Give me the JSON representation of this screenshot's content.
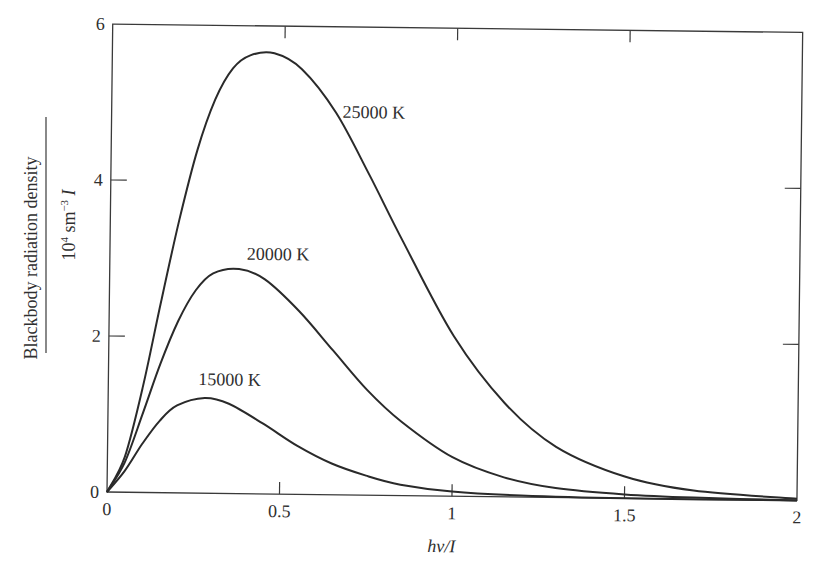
{
  "chart_data": {
    "type": "line",
    "title": "",
    "xlabel": "hv/I",
    "ylabel": {
      "numerator": "Blackbody radiation density",
      "denominator_base": "10",
      "denominator_exp1": "4",
      "denominator_mid": " sm",
      "denominator_exp2": "−3",
      "denominator_tail": " I"
    },
    "xlim": [
      0,
      2
    ],
    "ylim": [
      0,
      6
    ],
    "x_ticks": [
      "0",
      "0.5",
      "1",
      "1.5",
      "2"
    ],
    "y_ticks": [
      "0",
      "2",
      "4",
      "6"
    ],
    "grid": false,
    "legend": "inline labels",
    "series": [
      {
        "name": "25000 K",
        "label": "25000 K",
        "peak": {
          "x": 0.47,
          "y": 5.65
        },
        "x": [
          0,
          0.05,
          0.1,
          0.15,
          0.2,
          0.25,
          0.3,
          0.35,
          0.4,
          0.47,
          0.55,
          0.65,
          0.75,
          0.85,
          1.0,
          1.15,
          1.3,
          1.5,
          1.7,
          2.0
        ],
        "values": [
          0,
          0.45,
          1.35,
          2.45,
          3.5,
          4.4,
          5.05,
          5.45,
          5.62,
          5.65,
          5.45,
          4.9,
          4.1,
          3.25,
          2.05,
          1.2,
          0.65,
          0.28,
          0.11,
          0.02
        ]
      },
      {
        "name": "20000 K",
        "label": "20000 K",
        "peak": {
          "x": 0.375,
          "y": 2.88
        },
        "x": [
          0,
          0.05,
          0.1,
          0.15,
          0.2,
          0.25,
          0.3,
          0.375,
          0.45,
          0.55,
          0.65,
          0.75,
          0.85,
          1.0,
          1.15,
          1.3,
          1.5,
          1.7,
          2.0
        ],
        "values": [
          0,
          0.38,
          1.0,
          1.65,
          2.2,
          2.6,
          2.82,
          2.88,
          2.75,
          2.35,
          1.85,
          1.35,
          0.95,
          0.5,
          0.25,
          0.12,
          0.05,
          0.02,
          0.0
        ]
      },
      {
        "name": "15000 K",
        "label": "15000 K",
        "peak": {
          "x": 0.28,
          "y": 1.22
        },
        "x": [
          0,
          0.05,
          0.1,
          0.15,
          0.2,
          0.28,
          0.35,
          0.45,
          0.55,
          0.65,
          0.75,
          0.85,
          1.0,
          1.2,
          1.5,
          2.0
        ],
        "values": [
          0,
          0.27,
          0.62,
          0.92,
          1.12,
          1.22,
          1.15,
          0.9,
          0.62,
          0.4,
          0.25,
          0.14,
          0.06,
          0.02,
          0.0,
          0.0
        ]
      }
    ]
  },
  "labels": {
    "curve_25000": "25000 K",
    "curve_20000": "20000 K",
    "curve_15000": "15000 K"
  }
}
